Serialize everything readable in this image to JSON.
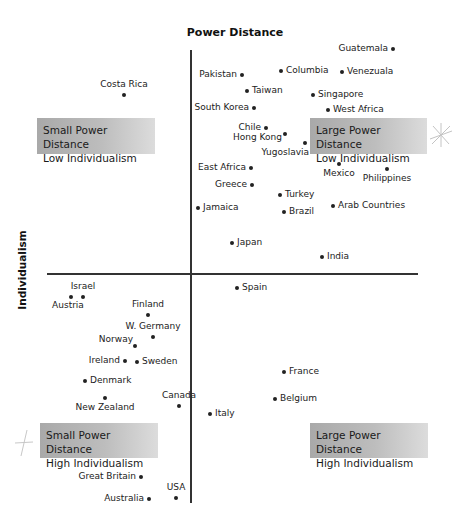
{
  "chart_data": {
    "type": "scatter",
    "title": "Power Distance",
    "xlabel": "Power Distance",
    "ylabel": "Individualism",
    "grid": false,
    "legend": "none",
    "axes": {
      "x_axis_y_px": 274,
      "y_axis_x_px": 191
    },
    "quadrants": [
      {
        "name": "small-pd-low-ind",
        "line1": "Small Power Distance",
        "line2": "Low Individualism"
      },
      {
        "name": "large-pd-low-ind",
        "line1": "Large Power Distance",
        "line2": "Low Individualism"
      },
      {
        "name": "small-pd-high-ind",
        "line1": "Small Power Distance",
        "line2": "High Individualism"
      },
      {
        "name": "large-pd-high-ind",
        "line1": "Large Power Distance",
        "line2": "High Individualism"
      }
    ],
    "points": [
      {
        "label": "Guatemala",
        "x": 393,
        "y": 49
      },
      {
        "label": "Pakistan",
        "x": 242,
        "y": 75
      },
      {
        "label": "Columbia",
        "x": 281,
        "y": 71
      },
      {
        "label": "Venezuala",
        "x": 342,
        "y": 72
      },
      {
        "label": "Costa Rica",
        "x": 124,
        "y": 95
      },
      {
        "label": "Taiwan",
        "x": 247,
        "y": 91
      },
      {
        "label": "Singapore",
        "x": 313,
        "y": 95
      },
      {
        "label": "South Korea",
        "x": 254,
        "y": 108
      },
      {
        "label": "West Africa",
        "x": 328,
        "y": 110
      },
      {
        "label": "Chile",
        "x": 266,
        "y": 128
      },
      {
        "label": "Hong Kong",
        "x": 285,
        "y": 134
      },
      {
        "label": "Yugoslavia",
        "x": 305,
        "y": 143
      },
      {
        "label": "East Africa",
        "x": 251,
        "y": 168
      },
      {
        "label": "Mexico",
        "x": 339,
        "y": 164
      },
      {
        "label": "Philippines",
        "x": 387,
        "y": 169
      },
      {
        "label": "Greece",
        "x": 252,
        "y": 185
      },
      {
        "label": "Turkey",
        "x": 280,
        "y": 195
      },
      {
        "label": "Jamaica",
        "x": 198,
        "y": 208
      },
      {
        "label": "Brazil",
        "x": 284,
        "y": 212
      },
      {
        "label": "Arab Countries",
        "x": 333,
        "y": 206
      },
      {
        "label": "Japan",
        "x": 232,
        "y": 243
      },
      {
        "label": "India",
        "x": 322,
        "y": 257
      },
      {
        "label": "Austria",
        "x": 71,
        "y": 297
      },
      {
        "label": "Israel",
        "x": 83,
        "y": 297
      },
      {
        "label": "Spain",
        "x": 237,
        "y": 288
      },
      {
        "label": "Finland",
        "x": 148,
        "y": 315
      },
      {
        "label": "W. Germany",
        "x": 153,
        "y": 337
      },
      {
        "label": "Norway",
        "x": 135,
        "y": 346
      },
      {
        "label": "Ireland",
        "x": 125,
        "y": 361
      },
      {
        "label": "Sweden",
        "x": 137,
        "y": 362
      },
      {
        "label": "Denmark",
        "x": 85,
        "y": 381
      },
      {
        "label": "France",
        "x": 284,
        "y": 372
      },
      {
        "label": "New Zealand",
        "x": 105,
        "y": 398
      },
      {
        "label": "Canada",
        "x": 179,
        "y": 406
      },
      {
        "label": "Belgium",
        "x": 275,
        "y": 399
      },
      {
        "label": "Italy",
        "x": 210,
        "y": 414
      },
      {
        "label": "Great Britain",
        "x": 141,
        "y": 477
      },
      {
        "label": "USA",
        "x": 176,
        "y": 498
      },
      {
        "label": "Australia",
        "x": 149,
        "y": 499
      }
    ]
  },
  "colors": {
    "axis": "#333333",
    "point": "#222222",
    "quadrant_bg_start": "#a9a9a9",
    "quadrant_bg_end": "#dcdcdc"
  }
}
